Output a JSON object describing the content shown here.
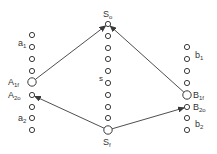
{
  "diagram": {
    "colors": {
      "stroke": "#3a3a3a",
      "background": "#ffffff"
    },
    "columns": {
      "left": {
        "x": 32,
        "nodes": [
          {
            "y": 35,
            "r": 2.6
          },
          {
            "y": 47,
            "r": 2.6
          },
          {
            "y": 59,
            "r": 2.6
          },
          {
            "y": 71,
            "r": 2.6
          },
          {
            "y": 82,
            "r": 4.2,
            "id": "A1f"
          },
          {
            "y": 95,
            "r": 2.6,
            "id": "A2o"
          },
          {
            "y": 107,
            "r": 2.6
          },
          {
            "y": 118,
            "r": 2.6
          },
          {
            "y": 130,
            "r": 2.6
          }
        ]
      },
      "middle": {
        "x": 108,
        "nodes": [
          {
            "y": 24,
            "r": 2.6,
            "id": "S0"
          },
          {
            "y": 36,
            "r": 2.6
          },
          {
            "y": 48,
            "r": 2.6
          },
          {
            "y": 59,
            "r": 2.6
          },
          {
            "y": 71,
            "r": 2.6
          },
          {
            "y": 83,
            "r": 2.6
          },
          {
            "y": 95,
            "r": 2.6
          },
          {
            "y": 107,
            "r": 2.6
          },
          {
            "y": 118,
            "r": 2.6
          },
          {
            "y": 130,
            "r": 4.2,
            "id": "Sf"
          }
        ]
      },
      "right": {
        "x": 187,
        "nodes": [
          {
            "y": 47,
            "r": 2.6
          },
          {
            "y": 59,
            "r": 2.6
          },
          {
            "y": 71,
            "r": 2.6
          },
          {
            "y": 83,
            "r": 2.6
          },
          {
            "y": 95,
            "r": 4.2,
            "id": "B1f"
          },
          {
            "y": 107,
            "r": 2.6,
            "id": "B2o"
          },
          {
            "y": 118,
            "r": 2.6
          },
          {
            "y": 130,
            "r": 2.6
          }
        ]
      }
    },
    "labels": {
      "a1": {
        "base": "a",
        "sub": "1"
      },
      "A1f": {
        "base": "A",
        "sub": "1f"
      },
      "A2o": {
        "base": "A",
        "sub": "2o"
      },
      "a2": {
        "base": "a",
        "sub": "2"
      },
      "S0": {
        "base": "S",
        "sub": "o"
      },
      "s": {
        "base": "s",
        "sub": ""
      },
      "Sf": {
        "base": "S",
        "sub": "f"
      },
      "b1": {
        "base": "b",
        "sub": "1"
      },
      "B1f": {
        "base": "B",
        "sub": "1f"
      },
      "B2o": {
        "base": "B",
        "sub": "2o"
      },
      "b2": {
        "base": "b",
        "sub": "2"
      }
    },
    "arrows": [
      {
        "from": "A1f",
        "to": "S0"
      },
      {
        "from": "B1f",
        "to": "S0"
      },
      {
        "from": "Sf",
        "to": "A2o"
      },
      {
        "from": "Sf",
        "to": "B2o"
      }
    ]
  }
}
